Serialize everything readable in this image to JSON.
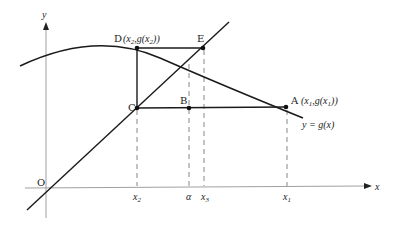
{
  "figure": {
    "axes": {
      "x_label": "x",
      "y_label": "y",
      "origin_label": "O"
    },
    "points": {
      "A": {
        "name": "A",
        "coord_label": "(x1, g(x1))"
      },
      "B": {
        "name": "B"
      },
      "C": {
        "name": "C"
      },
      "D": {
        "name": "D",
        "coord_label": "(x2, g(x2))"
      },
      "E": {
        "name": "E"
      }
    },
    "curve_label": "y = g(x)",
    "x_ticks": [
      "x2",
      "α",
      "x3",
      "x1"
    ],
    "colors": {
      "stroke": "#1a1a1a",
      "dash": "#555555"
    }
  }
}
